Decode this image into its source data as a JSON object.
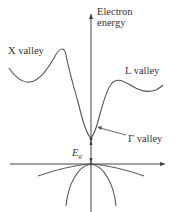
{
  "diagram": {
    "type": "band-structure",
    "axis_label": {
      "line1": "Electron",
      "line2": "energy"
    },
    "labels": {
      "x_valley": "X valley",
      "l_valley": "L valley",
      "gamma_valley": "Γ valley",
      "bandgap_symbol": "E",
      "bandgap_subscript": "g"
    },
    "colors": {
      "curve": "#555555",
      "axis": "#444444",
      "text": "#333333"
    }
  }
}
